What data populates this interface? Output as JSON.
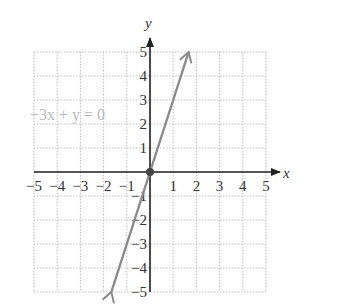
{
  "chart_data": {
    "type": "line",
    "title": "",
    "xlabel": "x",
    "ylabel": "y",
    "xlim": [
      -5,
      5
    ],
    "ylim": [
      -5,
      5
    ],
    "grid": true,
    "x_ticks": [
      "−5",
      "−4",
      "−3",
      "−2",
      "−1",
      "1",
      "2",
      "3",
      "4",
      "5"
    ],
    "y_ticks": [
      "5",
      "4",
      "3",
      "2",
      "1",
      "−1",
      "−2",
      "−3",
      "−4",
      "−5"
    ],
    "series": [
      {
        "name": "−3x + y = 0",
        "equation": "y = 3x",
        "x": [
          -1.667,
          0,
          1,
          1.667
        ],
        "y": [
          -5,
          0,
          3,
          5
        ],
        "arrows_both_ends": true,
        "color": "#8a8a8a"
      }
    ],
    "highlighted_points": [
      {
        "x": 0,
        "y": 0
      }
    ],
    "annotations": [
      {
        "text": "−3x + y = 0",
        "x": -3.2,
        "y": 2.5
      }
    ]
  },
  "labels": {
    "x_axis": "x",
    "y_axis": "y",
    "equation": "−3x + y = 0"
  },
  "colors": {
    "axis": "#222222",
    "grid": "#bdbdbd",
    "line": "#8a8a8a",
    "equation_text": "#b8b8b8"
  }
}
